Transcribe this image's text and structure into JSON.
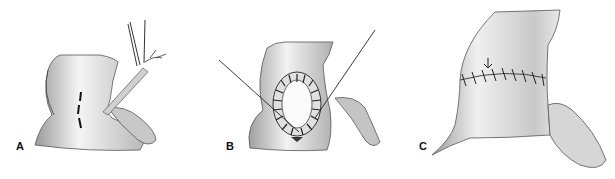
{
  "figure": {
    "panels": [
      {
        "id": "A",
        "label": "A",
        "description": "Incision line marked with dashed line; forceps holding tissue"
      },
      {
        "id": "B",
        "label": "B",
        "description": "Oval opening sutured circumferentially with stay sutures"
      },
      {
        "id": "C",
        "label": "C",
        "description": "Closed transverse suture line with arrow"
      }
    ]
  }
}
